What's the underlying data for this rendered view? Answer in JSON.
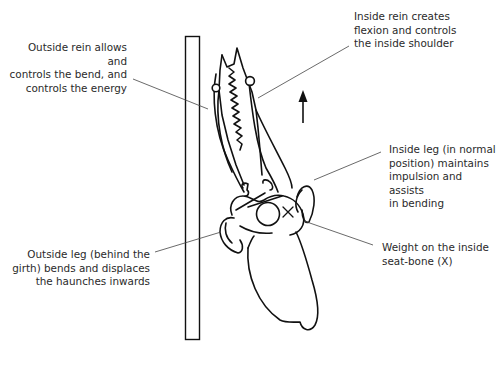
{
  "diagram": {
    "type": "annotated-illustration",
    "direction_arrow": "up",
    "labels": [
      {
        "id": "outside-rein",
        "text": "Outside rein allows and\ncontrols the bend, and\ncontrols the energy"
      },
      {
        "id": "inside-rein",
        "text": "Inside rein creates\nflexion and controls\nthe inside shoulder"
      },
      {
        "id": "inside-leg",
        "text": "Inside leg (in normal\nposition) maintains\nimpulsion and assists\nin bending"
      },
      {
        "id": "outside-leg",
        "text": "Outside leg (behind the\ngirth) bends and displaces\nthe haunches inwards"
      },
      {
        "id": "weight",
        "text": "Weight on the inside\nseat-bone (X)"
      }
    ],
    "seat_bone_marker": "X",
    "colors": {
      "line": "#111111",
      "leader": "#444444",
      "text": "#2a2a2a",
      "background": "#ffffff"
    }
  }
}
